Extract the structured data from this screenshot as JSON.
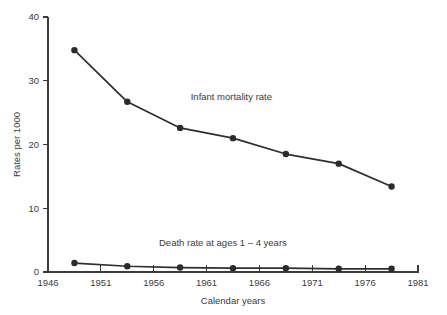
{
  "chart_data": {
    "type": "line",
    "title": "",
    "subtitle": "",
    "xlabel": "Calendar years",
    "ylabel": "Rates per 1000",
    "xlim": [
      1946,
      1981
    ],
    "ylim": [
      0,
      40
    ],
    "xticks": [
      1946,
      1951,
      1956,
      1961,
      1966,
      1971,
      1976,
      1981
    ],
    "xtick_labels": [
      "1946",
      "1951",
      "1956",
      "1961",
      "1966",
      "1971",
      "1976",
      "1981"
    ],
    "yticks": [
      0,
      10,
      20,
      30,
      40
    ],
    "ytick_labels": [
      "0",
      "10",
      "20",
      "30",
      "40"
    ],
    "grid": false,
    "legend_position": "inline-annotation",
    "x": [
      1948.5,
      1953.5,
      1958.5,
      1963.5,
      1968.5,
      1973.5,
      1978.5
    ],
    "series": [
      {
        "name": "Infant mortality rate",
        "values": [
          34.8,
          26.7,
          22.6,
          21.0,
          18.5,
          17.0,
          13.4
        ],
        "color": "#2e2e2e",
        "marker": "filled-circle",
        "label_x": 1959.5,
        "label_y": 27.0
      },
      {
        "name": "Death rate at ages 1 – 4 years",
        "values": [
          1.4,
          0.9,
          0.7,
          0.6,
          0.6,
          0.5,
          0.5
        ],
        "color": "#2e2e2e",
        "marker": "filled-circle",
        "label_x": 1956.5,
        "label_y": 4.1
      }
    ],
    "annotations": [
      {
        "text": "Infant mortality rate",
        "x": 1959.5,
        "y": 27.0
      },
      {
        "text": "Death rate at ages 1 – 4 years",
        "x": 1956.5,
        "y": 4.1
      }
    ],
    "colors": {
      "axis": "#3a3a3a",
      "line": "#2e2e2e",
      "marker": "#2b2b2b",
      "text": "#3b3b3b",
      "background": "#ffffff"
    }
  }
}
